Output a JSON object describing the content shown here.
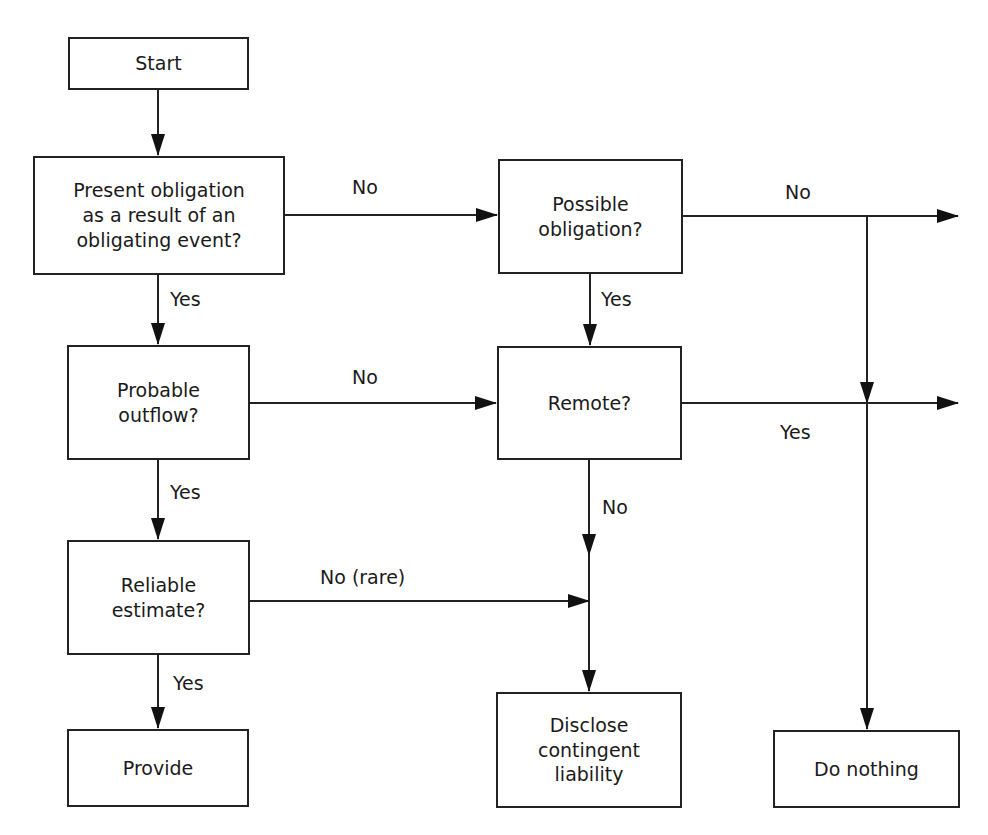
{
  "diagram": {
    "type": "flowchart",
    "nodes": {
      "start": "Start",
      "present_obligation": "Present obligation\nas a result of an\nobligating event?",
      "possible_obligation": "Possible\nobligation?",
      "probable_outflow": "Probable\noutflow?",
      "remote": "Remote?",
      "reliable_estimate": "Reliable\nestimate?",
      "provide": "Provide",
      "disclose": "Disclose\ncontingent\nliability",
      "do_nothing": "Do nothing"
    },
    "edge_labels": {
      "present_no": "No",
      "present_yes": "Yes",
      "possible_no": "No",
      "possible_yes": "Yes",
      "probable_no": "No",
      "probable_yes": "Yes",
      "remote_yes": "Yes",
      "remote_no": "No",
      "reliable_no": "No (rare)",
      "reliable_yes": "Yes"
    },
    "edges": [
      {
        "from": "start",
        "to": "present_obligation",
        "label": ""
      },
      {
        "from": "present_obligation",
        "to": "possible_obligation",
        "label": "No"
      },
      {
        "from": "present_obligation",
        "to": "probable_outflow",
        "label": "Yes"
      },
      {
        "from": "possible_obligation",
        "to": "do_nothing",
        "label": "No"
      },
      {
        "from": "possible_obligation",
        "to": "remote",
        "label": "Yes"
      },
      {
        "from": "probable_outflow",
        "to": "remote",
        "label": "No"
      },
      {
        "from": "probable_outflow",
        "to": "reliable_estimate",
        "label": "Yes"
      },
      {
        "from": "remote",
        "to": "do_nothing",
        "label": "Yes"
      },
      {
        "from": "remote",
        "to": "disclose",
        "label": "No"
      },
      {
        "from": "reliable_estimate",
        "to": "disclose",
        "label": "No (rare)"
      },
      {
        "from": "reliable_estimate",
        "to": "provide",
        "label": "Yes"
      }
    ]
  }
}
